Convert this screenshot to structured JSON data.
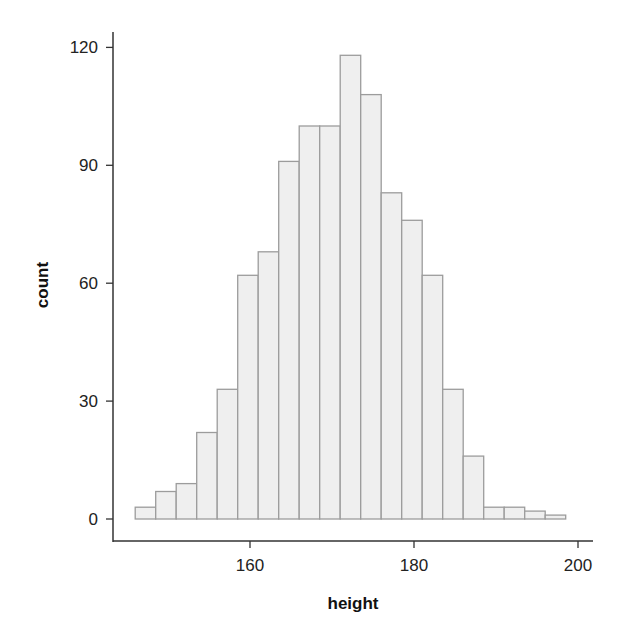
{
  "chart_data": {
    "type": "bar",
    "subtype": "histogram",
    "title": "",
    "xlabel": "height",
    "ylabel": "count",
    "bin_width": 2.5,
    "bin_start": 146,
    "bins": [
      {
        "x0": 146.0,
        "x1": 148.5,
        "count": 3
      },
      {
        "x0": 148.5,
        "x1": 151.0,
        "count": 7
      },
      {
        "x0": 151.0,
        "x1": 153.5,
        "count": 9
      },
      {
        "x0": 153.5,
        "x1": 156.0,
        "count": 22
      },
      {
        "x0": 156.0,
        "x1": 158.5,
        "count": 33
      },
      {
        "x0": 158.5,
        "x1": 161.0,
        "count": 62
      },
      {
        "x0": 161.0,
        "x1": 163.5,
        "count": 68
      },
      {
        "x0": 163.5,
        "x1": 166.0,
        "count": 91
      },
      {
        "x0": 166.0,
        "x1": 168.5,
        "count": 100
      },
      {
        "x0": 168.5,
        "x1": 171.0,
        "count": 100
      },
      {
        "x0": 171.0,
        "x1": 173.5,
        "count": 118
      },
      {
        "x0": 173.5,
        "x1": 176.0,
        "count": 108
      },
      {
        "x0": 176.0,
        "x1": 178.5,
        "count": 83
      },
      {
        "x0": 178.5,
        "x1": 181.0,
        "count": 76
      },
      {
        "x0": 181.0,
        "x1": 183.5,
        "count": 62
      },
      {
        "x0": 183.5,
        "x1": 186.0,
        "count": 33
      },
      {
        "x0": 186.0,
        "x1": 188.5,
        "count": 16
      },
      {
        "x0": 188.5,
        "x1": 191.0,
        "count": 3
      },
      {
        "x0": 191.0,
        "x1": 193.5,
        "count": 3
      },
      {
        "x0": 193.5,
        "x1": 196.0,
        "count": 2
      },
      {
        "x0": 196.0,
        "x1": 198.5,
        "count": 1
      }
    ],
    "x_ticks": [
      160,
      180,
      200
    ],
    "y_ticks": [
      0,
      30,
      60,
      90,
      120
    ],
    "xlim": [
      143.5,
      202
    ],
    "ylim": [
      -5.5,
      124
    ],
    "grid": false,
    "legend": null,
    "colors": {
      "bar_fill": "#efefef",
      "bar_stroke": "#9c9c9c",
      "axis": "#333333",
      "text": "#222222"
    }
  }
}
